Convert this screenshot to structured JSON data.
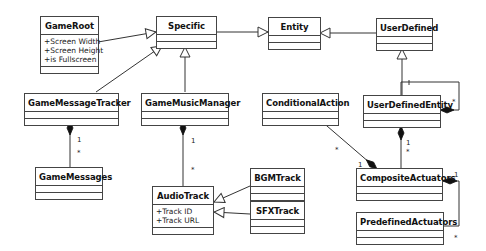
{
  "diagram": {
    "type": "UML class diagram",
    "classes": [
      {
        "id": "gameroot",
        "name": "GameRoot",
        "attributes": [
          "+Screen Width",
          "+Screen Height",
          "+is Fullscreen"
        ]
      },
      {
        "id": "specific",
        "name": "Specific",
        "attributes": []
      },
      {
        "id": "entity",
        "name": "Entity",
        "attributes": []
      },
      {
        "id": "userdefined",
        "name": "UserDefined",
        "attributes": []
      },
      {
        "id": "gamemessagetracker",
        "name": "GameMessageTracker",
        "attributes": []
      },
      {
        "id": "gamemusicmanager",
        "name": "GameMusicManager",
        "attributes": []
      },
      {
        "id": "conditionalaction",
        "name": "ConditionalAction",
        "attributes": []
      },
      {
        "id": "userdefinedentity",
        "name": "UserDefinedEntity",
        "attributes": []
      },
      {
        "id": "gamemessages",
        "name": "GameMessages",
        "attributes": []
      },
      {
        "id": "bgmtrack",
        "name": "BGMTrack",
        "attributes": []
      },
      {
        "id": "audiotrack",
        "name": "AudioTrack",
        "attributes": [
          "+Track ID",
          "+Track URL"
        ]
      },
      {
        "id": "sfxtrack",
        "name": "SFXTrack",
        "attributes": []
      },
      {
        "id": "compositeactuators",
        "name": "CompositeActuators",
        "attributes": []
      },
      {
        "id": "predefinedactuators",
        "name": "PredefinedActuators",
        "attributes": []
      }
    ],
    "relationships": [
      {
        "type": "generalization",
        "from": "GameRoot",
        "to": "Specific"
      },
      {
        "type": "generalization",
        "from": "GameMessageTracker",
        "to": "Specific"
      },
      {
        "type": "generalization",
        "from": "GameMusicManager",
        "to": "Specific"
      },
      {
        "type": "generalization",
        "from": "Specific",
        "to": "Entity"
      },
      {
        "type": "generalization",
        "from": "UserDefined",
        "to": "Entity"
      },
      {
        "type": "generalization",
        "from": "UserDefinedEntity",
        "to": "UserDefined"
      },
      {
        "type": "generalization",
        "from": "BGMTrack",
        "to": "AudioTrack"
      },
      {
        "type": "generalization",
        "from": "SFXTrack",
        "to": "AudioTrack"
      },
      {
        "type": "composition",
        "whole": "GameMessageTracker",
        "part": "GameMessages",
        "whole_mult": "1",
        "part_mult": "*"
      },
      {
        "type": "composition",
        "whole": "GameMusicManager",
        "part": "AudioTrack",
        "whole_mult": "1",
        "part_mult": "*"
      },
      {
        "type": "composition",
        "whole": "UserDefinedEntity",
        "part": "UserDefinedEntity",
        "whole_mult": "*",
        "part_mult": "1"
      },
      {
        "type": "composition",
        "whole": "UserDefinedEntity",
        "part": "CompositeActuators",
        "whole_mult": "1",
        "part_mult": "*"
      },
      {
        "type": "composition",
        "whole": "CompositeActuators",
        "part": "ConditionalAction",
        "whole_mult": "1",
        "part_mult": "*"
      },
      {
        "type": "composition",
        "whole": "CompositeActuators",
        "part": "PredefinedActuators",
        "whole_mult": "1",
        "part_mult": "*"
      }
    ],
    "multiplicities": {
      "one": "1",
      "many": "*"
    }
  }
}
